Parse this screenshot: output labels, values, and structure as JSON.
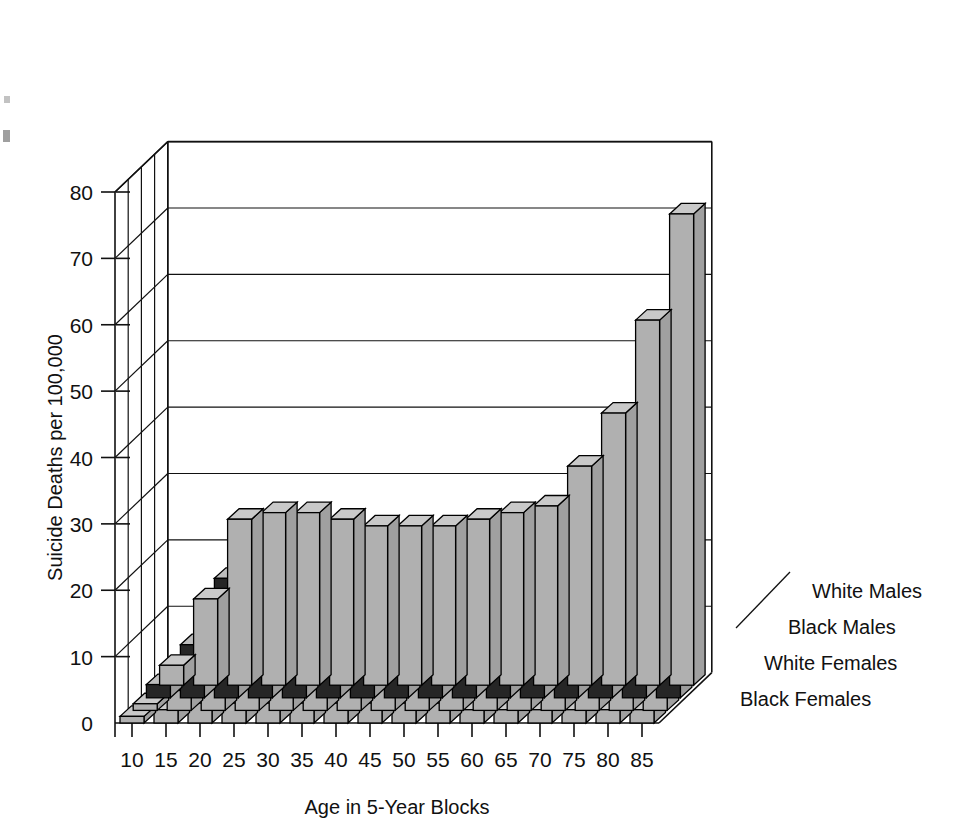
{
  "chart_data": {
    "type": "bar",
    "subtype": "3d-grouped-bar",
    "title": "",
    "xlabel": "Age in 5-Year Blocks",
    "ylabel": "Suicide Deaths per 100,000",
    "categories": [
      "10",
      "15",
      "20",
      "25",
      "30",
      "35",
      "40",
      "45",
      "50",
      "55",
      "60",
      "65",
      "70",
      "75",
      "80",
      "85"
    ],
    "ylim": [
      0,
      80
    ],
    "yticks": [
      0,
      10,
      20,
      30,
      40,
      50,
      60,
      70,
      80
    ],
    "grid": true,
    "legend_position": "right-stepped",
    "series": [
      {
        "name": "White Males",
        "color": "#b0b0b0",
        "depth_index": 0,
        "values": [
          3,
          13,
          25,
          26,
          26,
          25,
          24,
          24,
          24,
          25,
          26,
          27,
          33,
          41,
          55,
          71
        ]
      },
      {
        "name": "Black Males",
        "color": "#262626",
        "depth_index": 1,
        "values": [
          2,
          8,
          18,
          22,
          21,
          18,
          15,
          14,
          13,
          12,
          12,
          12,
          13,
          14,
          13,
          12
        ]
      },
      {
        "name": "White Females",
        "color": "#b0b0b0",
        "depth_index": 2,
        "values": [
          1,
          3,
          5,
          6,
          7,
          8,
          9,
          9,
          9,
          9,
          8,
          7,
          6,
          6,
          5,
          5
        ]
      },
      {
        "name": "Black Females",
        "color": "#b0b0b0",
        "depth_index": 3,
        "values": [
          1,
          2,
          3,
          3,
          3,
          3,
          3,
          3,
          3,
          3,
          2,
          2,
          2,
          2,
          2,
          2
        ]
      }
    ]
  },
  "axes": {
    "y_title": "Suicide Deaths per 100,000",
    "x_title": "Age in 5-Year Blocks",
    "y_tick_labels": [
      "0",
      "10",
      "20",
      "30",
      "40",
      "50",
      "60",
      "70",
      "80"
    ],
    "x_tick_labels": [
      "10",
      "15",
      "20",
      "25",
      "30",
      "35",
      "40",
      "45",
      "50",
      "55",
      "60",
      "65",
      "70",
      "75",
      "80",
      "85"
    ]
  },
  "legend": {
    "items": [
      {
        "label": "White Males"
      },
      {
        "label": "Black Males"
      },
      {
        "label": "White Females"
      },
      {
        "label": "Black Females"
      }
    ]
  },
  "colors": {
    "bar_light": "#b0b0b0",
    "bar_light_top": "#c9c9c9",
    "bar_light_side": "#a0a0a0",
    "bar_dark": "#262626",
    "bar_dark_top": "#bdbdbd",
    "bar_dark_side": "#9c9c9c",
    "ink": "#111111",
    "background": "#ffffff"
  },
  "artifacts": {
    "edge_marks": [
      "'",
      "e"
    ]
  }
}
